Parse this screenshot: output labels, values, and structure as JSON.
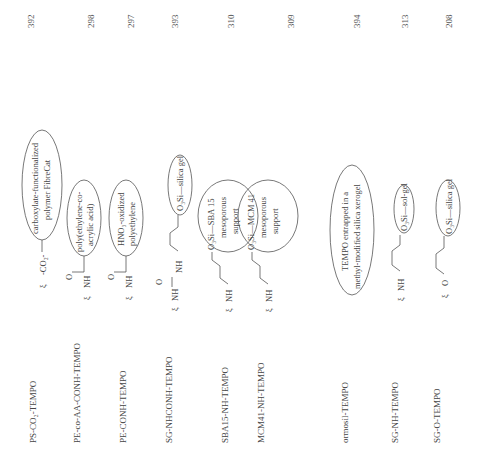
{
  "table": {
    "orientation": "rotated-90-ccw",
    "columns": [
      "Catalyst",
      "Structure",
      "Ref."
    ],
    "rows": [
      {
        "name": "PS-CO₂-TEMPO",
        "support_label": [
          "carboxylate-functionalized",
          "polymer FibreCat"
        ],
        "linker": "-CO₂-",
        "ref": "392"
      },
      {
        "name": "PE-co-AA-CONH-TEMPO",
        "support_label": [
          "poly(ethylene-co-",
          "acrylic acid)"
        ],
        "linker": "O=C-NH",
        "ref": "298"
      },
      {
        "name": "PE-CONH-TEMPO",
        "support_label": [
          "HNO₃-oxidized",
          "polyethylene"
        ],
        "linker": "O=C-NH",
        "ref": "297"
      },
      {
        "name": "SG-NHCONH-TEMPO",
        "support_label": [
          "O₃Si—silica gel"
        ],
        "linker": "NH-C(=O)-NH",
        "ref": "393"
      },
      {
        "name": "SBA15-NH-TEMPO",
        "support_label": [
          "O₃Si—SBA 15",
          "mesoporous",
          "support"
        ],
        "linker": "NH",
        "ref": "310"
      },
      {
        "name": "MCM41-NH-TEMPO",
        "support_label": [
          "O₃Si—MCM 41",
          "mesoporous",
          "support"
        ],
        "linker": "NH",
        "ref": "309"
      },
      {
        "name": "ormosil-TEMPO",
        "support_label": [
          "TEMPO entrapped in a",
          "methyl-modified silica xerogel"
        ],
        "linker": "",
        "ref": "394"
      },
      {
        "name": "SG-NH-TEMPO",
        "support_label": [
          "O₃Si—sol-gel"
        ],
        "linker": "NH",
        "ref": "313"
      },
      {
        "name": "SG-O-TEMPO",
        "support_label": [
          "O₃Si—silica gel"
        ],
        "linker": "O",
        "ref": "208"
      }
    ]
  },
  "labels": {
    "nh": "NH",
    "o": "O",
    "co2": "CO₂"
  }
}
